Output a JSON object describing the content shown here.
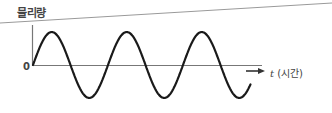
{
  "diagram": {
    "y_axis_label": "물리량",
    "origin_label": "0",
    "x_axis_variable": "t",
    "x_axis_unit": "(시간)",
    "colors": {
      "curve": "#1a1a1a",
      "axis": "#777777",
      "border": "#999999"
    }
  },
  "chart_data": {
    "type": "line",
    "title": "",
    "xlabel": "t (시간)",
    "ylabel": "물리량",
    "function": "y = A sin(2πt/T)",
    "cycles_shown": 2.9,
    "grid": false,
    "legend": null
  }
}
